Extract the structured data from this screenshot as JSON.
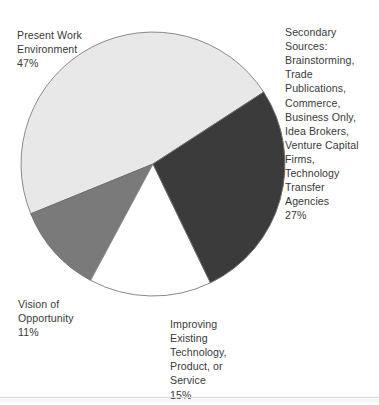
{
  "chart_data": {
    "type": "pie",
    "title": "",
    "subtitle": "",
    "xlabel": "",
    "ylabel": "",
    "legend_position": "none",
    "grid": false,
    "total_label": "100%",
    "geometry": {
      "center_x": 153,
      "center_y": 164,
      "radius": 132,
      "start_angle_deg": 57,
      "direction": "clockwise"
    },
    "slices": [
      {
        "name": "secondary-sources",
        "label": "Secondary Sources: Brainstorming, Trade Publications, Commerce, Business Only, Idea Brokers, Venture Capital Firms, Technology Transfer Agencies",
        "value": 27,
        "value_label": "27%",
        "color": "#3b3b3b",
        "stroke": "#6e6e6e"
      },
      {
        "name": "improving-existing-technology",
        "label": "Improving Existing Technology, Product, or Service",
        "value": 15,
        "value_label": "15%",
        "color": "#ffffff",
        "stroke": "#8a8a8a"
      },
      {
        "name": "vision-of-opportunity",
        "label": "Vision of Opportunity",
        "value": 11,
        "value_label": "11%",
        "color": "#7a7a7a",
        "stroke": "#6e6e6e"
      },
      {
        "name": "present-work-environment",
        "label": "Present Work Environment",
        "value": 47,
        "value_label": "47%",
        "color": "#e8e8e8",
        "stroke": "#8a8a8a"
      }
    ]
  },
  "labels": {
    "present_work": {
      "text": "Present Work\nEnvironment",
      "percent": "47%"
    },
    "secondary_sources": {
      "text": "Secondary\nSources:\nBrainstorming,\nTrade\nPublications,\nCommerce,\nBusiness Only,\nIdea Brokers,\nVenture Capital\nFirms,\nTechnology\nTransfer\nAgencies",
      "percent": "27%"
    },
    "improving_existing": {
      "text": "Improving\nExisting\nTechnology,\nProduct, or\nService",
      "percent": "15%"
    },
    "vision_opportunity": {
      "text": "Vision of\nOpportunity",
      "percent": "11%"
    }
  },
  "colors": {
    "background": "#ffffff",
    "text": "#3a3a3a",
    "slice_light": "#e8e8e8",
    "slice_dark": "#3b3b3b",
    "slice_medium": "#7a7a7a",
    "slice_white": "#ffffff",
    "outline": "#8a8a8a",
    "divider": "#d8d8d8"
  }
}
